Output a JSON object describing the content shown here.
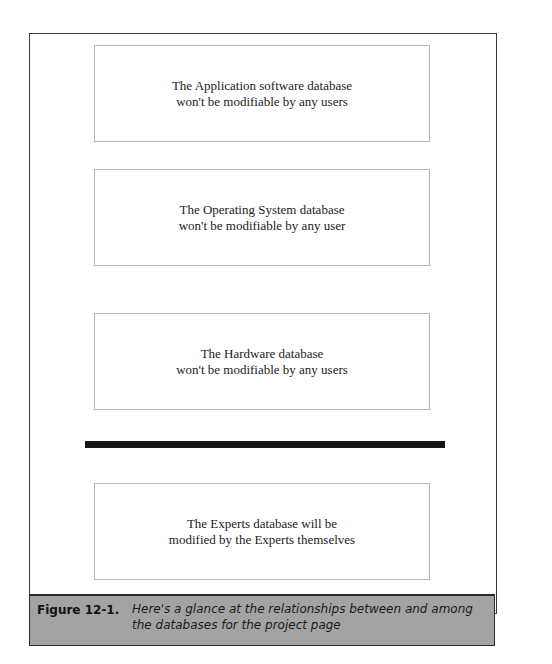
{
  "boxes": [
    {
      "line1": "The Application software database",
      "line2": "won't be modifiable by any users"
    },
    {
      "line1": "The Operating System database",
      "line2": "won't be modifiable by any user"
    },
    {
      "line1": "The Hardware database",
      "line2": "won't be modifiable by any users"
    },
    {
      "line1": "The Experts database will be",
      "line2": "modified by the Experts themselves"
    }
  ],
  "caption": {
    "label": "Figure 12-1.",
    "text": "Here's a glance at the relationships between and among the databases for the project page"
  },
  "colors": {
    "divider": "#151515",
    "caption_bg": "#a3a3a3"
  }
}
